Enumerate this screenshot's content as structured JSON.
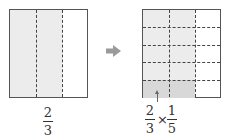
{
  "left_figure": {
    "whole_columns": 3,
    "shaded_columns": 2,
    "label": {
      "numerator": "2",
      "denominator": "3"
    }
  },
  "arrow": {
    "icon": "right-arrow-icon",
    "color": "#9a9a9a"
  },
  "right_figure": {
    "columns": 3,
    "rows": 5,
    "shaded_columns": 2,
    "highlighted_rows": 1,
    "label": {
      "first": {
        "numerator": "2",
        "denominator": "3"
      },
      "operator": "×",
      "second": {
        "numerator": "1",
        "denominator": "5"
      }
    }
  },
  "colors": {
    "shade_light": "#ececec",
    "shade_dark": "#d8d8d8",
    "border": "#555555"
  }
}
